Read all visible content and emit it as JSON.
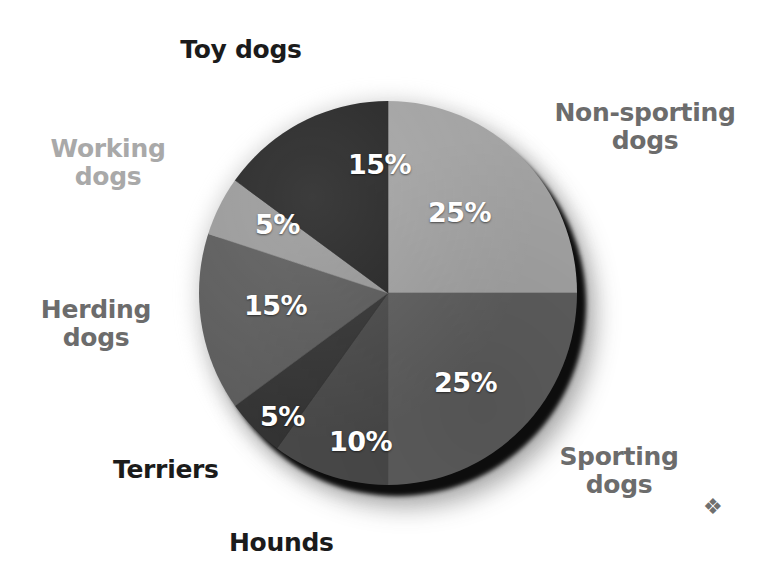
{
  "figure": {
    "background_color": "#ffffff",
    "ornament_glyph": "❖"
  },
  "chart_data": {
    "type": "pie",
    "title": "",
    "subtitle": "",
    "xlabel": "",
    "ylabel": "",
    "legend_position": "outside-labels",
    "grid": false,
    "units": "percent",
    "total": 100,
    "start_angle_deg": 0,
    "direction": "clockwise",
    "categories": [
      "Non-sporting dogs",
      "Sporting dogs",
      "Hounds",
      "Terriers",
      "Herding dogs",
      "Working dogs",
      "Toy dogs"
    ],
    "values": [
      25,
      25,
      10,
      5,
      15,
      5,
      15
    ],
    "value_labels": [
      "25%",
      "25%",
      "10%",
      "5%",
      "15%",
      "5%",
      "15%"
    ],
    "colors": [
      "#a3a3a3",
      "#5e5e5e",
      "#4a4a4a",
      "#343434",
      "#5c5c5c",
      "#9a9a9a",
      "#262626"
    ],
    "slices": [
      {
        "name": "Non-sporting dogs",
        "value": 25,
        "value_label": "25%",
        "color": "#a3a3a3",
        "start_deg": 0,
        "end_deg": 90,
        "label_color_class": "mid"
      },
      {
        "name": "Sporting dogs",
        "value": 25,
        "value_label": "25%",
        "color": "#5e5e5e",
        "start_deg": 90,
        "end_deg": 180,
        "label_color_class": "mid"
      },
      {
        "name": "Hounds",
        "value": 10,
        "value_label": "10%",
        "color": "#4a4a4a",
        "start_deg": 180,
        "end_deg": 216,
        "label_color_class": "dark"
      },
      {
        "name": "Terriers",
        "value": 5,
        "value_label": "5%",
        "color": "#343434",
        "start_deg": 216,
        "end_deg": 234,
        "label_color_class": "dark"
      },
      {
        "name": "Herding dogs",
        "value": 15,
        "value_label": "15%",
        "color": "#5c5c5c",
        "start_deg": 234,
        "end_deg": 288,
        "label_color_class": "mid"
      },
      {
        "name": "Working dogs",
        "value": 5,
        "value_label": "5%",
        "color": "#9a9a9a",
        "start_deg": 288,
        "end_deg": 306,
        "label_color_class": "light"
      },
      {
        "name": "Toy dogs",
        "value": 15,
        "value_label": "15%",
        "color": "#262626",
        "start_deg": 306,
        "end_deg": 360,
        "label_color_class": "dark"
      }
    ]
  },
  "labels": {
    "toy_dogs": "Toy dogs",
    "non_sporting_dogs": "Non-sporting\ndogs",
    "working_dogs": "Working\ndogs",
    "herding_dogs": "Herding\ndogs",
    "terriers": "Terriers",
    "hounds": "Hounds",
    "sporting_dogs": "Sporting\ndogs"
  },
  "percentages": {
    "toy_dogs": "15%",
    "non_sporting_dogs": "25%",
    "working_dogs": "5%",
    "herding_dogs": "15%",
    "terriers": "5%",
    "hounds": "10%",
    "sporting_dogs": "25%"
  }
}
